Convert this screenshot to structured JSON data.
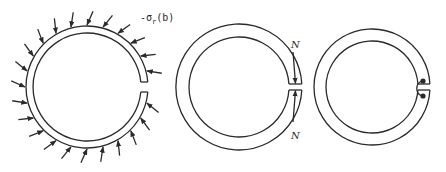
{
  "figure": {
    "panels": [
      {
        "id": "ring-with-pressure",
        "description": "Split ring with radial pressure arrows on outer surface",
        "label_prefix": "-σ",
        "label_subscript": "r",
        "label_suffix": "(b)",
        "arrow_count": 24
      },
      {
        "id": "ring-with-normal-force",
        "description": "Split ring with axial forces N at the gap",
        "force_label_top": "N",
        "force_label_bottom": "N"
      },
      {
        "id": "ring-with-joint",
        "description": "Split ring with pinned connection at the gap"
      }
    ],
    "colors": {
      "line": "#2a2a2a",
      "background": "#ffffff"
    }
  }
}
